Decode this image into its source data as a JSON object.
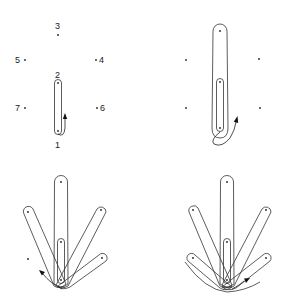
{
  "figure": {
    "colors": {
      "line": "#333333",
      "dot": "#222222",
      "background": "#ffffff"
    }
  },
  "panels": [
    {
      "id": "top-left",
      "points": [
        {
          "label": "1",
          "x": 58,
          "y": 131
        },
        {
          "label": "2",
          "x": 58,
          "y": 83
        },
        {
          "label": "3",
          "x": 58,
          "y": 35
        },
        {
          "label": "4",
          "x": 96,
          "y": 60
        },
        {
          "label": "5",
          "x": 25,
          "y": 60
        },
        {
          "label": "6",
          "x": 97,
          "y": 108
        },
        {
          "label": "7",
          "x": 25,
          "y": 108
        }
      ],
      "loops": [
        "1-2"
      ],
      "arrow_direction": "up-right"
    },
    {
      "id": "top-right",
      "points": 7,
      "loops": [
        "1-2",
        "1-3"
      ],
      "arrow_direction": "up-right"
    },
    {
      "id": "bottom-left",
      "points": 7,
      "loops": [
        "1-2",
        "1-3",
        "1-4",
        "1-5",
        "1-6"
      ],
      "arrow_direction": "up-left"
    },
    {
      "id": "bottom-right",
      "points": 7,
      "loops": [
        "1-2",
        "1-3",
        "1-4",
        "1-5",
        "1-6",
        "1-7"
      ],
      "arrow_direction": "right"
    }
  ],
  "labels": {
    "p1": "1",
    "p2": "2",
    "p3": "3",
    "p4": "4",
    "p5": "5",
    "p6": "6",
    "p7": "7"
  }
}
